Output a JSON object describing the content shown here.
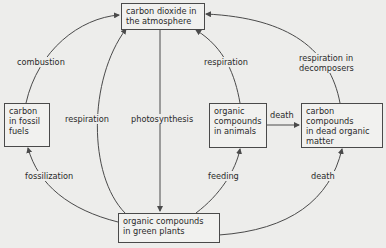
{
  "nodes": {
    "atmosphere": {
      "label": "carbon dioxide in\nthe atmosphere"
    },
    "fossil": {
      "label": "carbon\nin fossil\nfuels"
    },
    "animals": {
      "label": "organic\ncompounds\nin animals"
    },
    "dead": {
      "label": "carbon compounds\nin dead organic\nmatter"
    },
    "plants": {
      "label": "organic compounds\nin green plants"
    }
  },
  "edges": {
    "combustion": {
      "label": "combustion",
      "from": "fossil",
      "to": "atmosphere"
    },
    "respiration_plants": {
      "label": "respiration",
      "from": "plants",
      "to": "atmosphere"
    },
    "photosynthesis": {
      "label": "photosynthesis",
      "from": "atmosphere",
      "to": "plants"
    },
    "respiration_animals": {
      "label": "respiration",
      "from": "animals",
      "to": "atmosphere"
    },
    "respiration_decomposers": {
      "label": "respiration in\ndecomposers",
      "from": "dead",
      "to": "atmosphere"
    },
    "death_animals": {
      "label": "death",
      "from": "animals",
      "to": "dead"
    },
    "fossilization": {
      "label": "fossilization",
      "from": "plants",
      "to": "fossil"
    },
    "feeding": {
      "label": "feeding",
      "from": "plants",
      "to": "animals"
    },
    "death_plants": {
      "label": "death",
      "from": "plants",
      "to": "dead"
    }
  },
  "colors": {
    "background": "#ededeb",
    "line": "#4a4a4a",
    "text": "#2a2a2a"
  }
}
